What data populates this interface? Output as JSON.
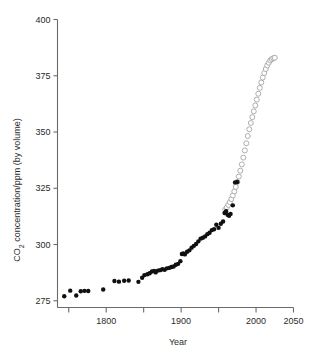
{
  "chart_data": {
    "type": "scatter",
    "title": "",
    "xlabel": "Year",
    "ylabel": "CO2 concentration/ppm (by volume)",
    "ylabel_parts": {
      "prefix": "CO",
      "sub": "2",
      "suffix": " concentration/ppm (by volume)"
    },
    "xlim": [
      1735,
      2050
    ],
    "ylim": [
      272,
      400
    ],
    "xticks": [
      1800,
      1900,
      2000,
      2050
    ],
    "xticklabels": [
      "1800",
      "1900",
      "2000",
      "2050"
    ],
    "xminorticks": [
      1750,
      1850,
      1950
    ],
    "yticks": [
      275,
      300,
      325,
      350,
      375,
      400
    ],
    "yticklabels": [
      "275",
      "300",
      "325",
      "350",
      "375",
      "400"
    ],
    "grid": false,
    "legend": "none",
    "colors": {
      "filled_marker": "#101010",
      "open_marker_edge": "#9a9a9a",
      "axis": "#6b6b6b",
      "text": "#2b2b2b",
      "background": "#ffffff"
    },
    "series": [
      {
        "name": "Measured record (filled circles)",
        "marker": "filled-circle",
        "x": [
          1744,
          1752,
          1760,
          1766,
          1771,
          1776,
          1796,
          1811,
          1817,
          1824,
          1830,
          1843,
          1848,
          1851,
          1855,
          1858,
          1861,
          1864,
          1866,
          1869,
          1872,
          1875,
          1878,
          1881,
          1884,
          1887,
          1890,
          1893,
          1896,
          1899,
          1901,
          1903,
          1905,
          1908,
          1911,
          1914,
          1917,
          1920,
          1923,
          1926,
          1929,
          1932,
          1935,
          1938,
          1941,
          1944,
          1947,
          1950,
          1953,
          1956,
          1958,
          1960,
          1962,
          1964,
          1966,
          1969,
          1972,
          1975
        ],
        "y": [
          277.0,
          279.5,
          277.3,
          279.2,
          279.4,
          279.3,
          280.0,
          283.8,
          283.5,
          283.9,
          284.0,
          283.4,
          285.2,
          286.4,
          286.8,
          287.2,
          288.0,
          288.2,
          287.6,
          288.4,
          288.6,
          289.0,
          288.8,
          289.4,
          289.6,
          290.0,
          290.2,
          291.0,
          291.4,
          292.6,
          295.8,
          296.0,
          295.6,
          296.8,
          297.4,
          298.6,
          299.4,
          300.2,
          301.4,
          302.6,
          303.0,
          303.6,
          304.6,
          305.2,
          306.4,
          306.8,
          308.8,
          307.4,
          309.2,
          310.2,
          314.0,
          314.8,
          313.2,
          312.8,
          313.6,
          317.4,
          327.6,
          327.8
        ]
      },
      {
        "name": "Projection / continuous record (open circles)",
        "marker": "open-circle",
        "x": [
          1959,
          1961,
          1963,
          1965,
          1967,
          1969,
          1971,
          1973,
          1975,
          1977,
          1979,
          1981,
          1983,
          1985,
          1987,
          1989,
          1991,
          1993,
          1995,
          1997,
          1999,
          2001,
          2003,
          2005,
          2007,
          2009,
          2011,
          2013,
          2015,
          2017,
          2019,
          2021,
          2023,
          2025
        ],
        "y": [
          315.5,
          316.5,
          317.6,
          318.8,
          320.2,
          321.8,
          323.6,
          325.6,
          327.8,
          330.2,
          332.8,
          335.6,
          338.6,
          341.8,
          345.0,
          348.2,
          351.2,
          354.0,
          356.6,
          359.2,
          361.8,
          364.4,
          367.0,
          369.6,
          372.0,
          374.2,
          376.2,
          378.0,
          379.6,
          380.8,
          381.8,
          382.4,
          382.8,
          383.0
        ]
      }
    ]
  },
  "axis": {
    "x_title": "Year",
    "y_title_prefix": "CO",
    "y_title_sub": "2",
    "y_title_suffix": " concentration/ppm (by volume)"
  }
}
